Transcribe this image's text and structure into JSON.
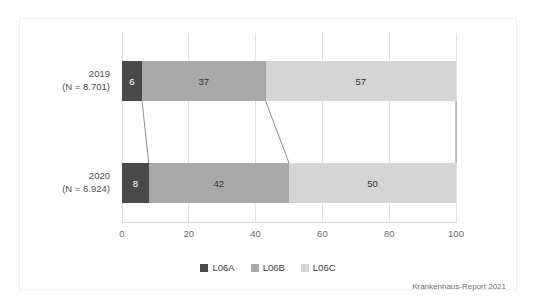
{
  "chart_data": {
    "type": "bar",
    "orientation": "horizontal",
    "stacked": true,
    "normalized_percent": true,
    "title": "",
    "subtitle": "",
    "xlabel": "",
    "ylabel": "",
    "xlim": [
      0,
      100
    ],
    "xticks": [
      0,
      20,
      40,
      60,
      80,
      100
    ],
    "xtick_labels": [
      "0",
      "20",
      "40",
      "60",
      "80",
      "100"
    ],
    "grid": true,
    "grid_axis": "x",
    "legend_position": "bottom-center",
    "categories": [
      "2019\n(N = 8.701)",
      "2020\n(N = 6.924)"
    ],
    "category_rows": [
      {
        "year": "2019",
        "n_label": "(N = 8.701)"
      },
      {
        "year": "2020",
        "n_label": "(N = 6.924)"
      }
    ],
    "series": [
      {
        "name": "L06A",
        "color": "#4a4a4a",
        "values": [
          6,
          8
        ]
      },
      {
        "name": "L06B",
        "color": "#a9a9a9",
        "values": [
          37,
          42
        ]
      },
      {
        "name": "L06C",
        "color": "#d5d5d5",
        "values": [
          57,
          50
        ]
      }
    ],
    "bars": [
      {
        "category": "2019",
        "segments": [
          {
            "series": "L06A",
            "value": 6,
            "label": "6",
            "color": "#4a4a4a"
          },
          {
            "series": "L06B",
            "value": 37,
            "label": "37",
            "color": "#a9a9a9"
          },
          {
            "series": "L06C",
            "value": 57,
            "label": "57",
            "color": "#d5d5d5"
          }
        ]
      },
      {
        "category": "2020",
        "segments": [
          {
            "series": "L06A",
            "value": 8,
            "label": "8",
            "color": "#4a4a4a"
          },
          {
            "series": "L06B",
            "value": 42,
            "label": "42",
            "color": "#a9a9a9"
          },
          {
            "series": "L06C",
            "value": 50,
            "label": "50",
            "color": "#d5d5d5"
          }
        ]
      }
    ],
    "connectors": [
      {
        "from_x": 6,
        "to_x": 8,
        "color": "#8c8c8c"
      },
      {
        "from_x": 43,
        "to_x": 50,
        "color": "#8c8c8c"
      },
      {
        "from_x": 100,
        "to_x": 100,
        "color": "#8c8c8c"
      }
    ],
    "legend": [
      {
        "label": "L06A",
        "color": "#4a4a4a"
      },
      {
        "label": "L06B",
        "color": "#a9a9a9"
      },
      {
        "label": "L06C",
        "color": "#d5d5d5"
      }
    ],
    "annotations": {
      "source": "Krankenhaus-Report 2021"
    }
  },
  "colors": {
    "l06a": "#4a4a4a",
    "l06b": "#a9a9a9",
    "l06c": "#d5d5d5",
    "gridline": "#e2e2e2",
    "axis": "#d8d8d8",
    "connector": "#8c8c8c",
    "frame": "#f0f0f0",
    "text": "#3a3a3a",
    "tick_text": "#6a6a6a"
  }
}
